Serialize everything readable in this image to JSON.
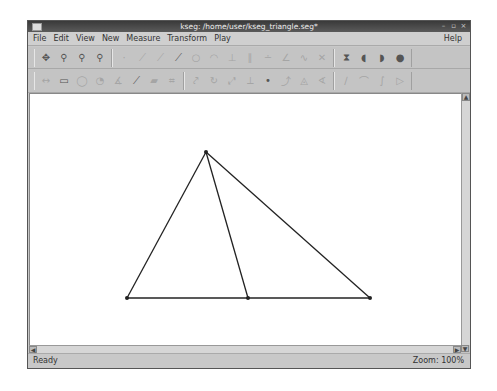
{
  "window": {
    "title": "kseg: /home/user/kseg_triangle.seg*",
    "controls": [
      "minimize",
      "maximize",
      "close"
    ]
  },
  "menubar": {
    "items": [
      {
        "label": "File",
        "accel": "F"
      },
      {
        "label": "Edit",
        "accel": "E"
      },
      {
        "label": "View",
        "accel": "V"
      },
      {
        "label": "New",
        "accel": "N"
      },
      {
        "label": "Measure",
        "accel": "u"
      },
      {
        "label": "Transform",
        "accel": "T"
      },
      {
        "label": "Play",
        "accel": "P"
      }
    ],
    "help": "Help"
  },
  "toolbar1": {
    "groups": [
      [
        {
          "name": "move-icon",
          "glyph": "✥",
          "enabled": true
        },
        {
          "name": "select-label-icon",
          "glyph": "⚲",
          "enabled": true
        },
        {
          "name": "select-grid-icon",
          "glyph": "⚲",
          "enabled": true
        },
        {
          "name": "select-text-icon",
          "glyph": "⚲",
          "enabled": true
        }
      ],
      [
        {
          "name": "point-icon",
          "glyph": "·",
          "enabled": false
        },
        {
          "name": "segment-icon",
          "glyph": "⟋",
          "enabled": false
        },
        {
          "name": "ray-icon",
          "glyph": "⟋",
          "enabled": false
        },
        {
          "name": "line-icon",
          "glyph": "⟋",
          "enabled": true
        },
        {
          "name": "circle-icon",
          "glyph": "○",
          "enabled": false
        },
        {
          "name": "arc-icon",
          "glyph": "◠",
          "enabled": false
        },
        {
          "name": "perpendicular-icon",
          "glyph": "⊥",
          "enabled": false
        },
        {
          "name": "parallel-icon",
          "glyph": "∥",
          "enabled": false
        },
        {
          "name": "midpoint-icon",
          "glyph": "∸",
          "enabled": false
        },
        {
          "name": "bisector-icon",
          "glyph": "∠",
          "enabled": false
        },
        {
          "name": "locus-icon",
          "glyph": "∿",
          "enabled": false
        },
        {
          "name": "intersection-icon",
          "glyph": "✕",
          "enabled": false
        }
      ],
      [
        {
          "name": "polygon-fill-icon",
          "glyph": "⧗",
          "enabled": true
        },
        {
          "name": "circle-interior-icon",
          "glyph": "◖",
          "enabled": true
        },
        {
          "name": "arc-sector-icon",
          "glyph": "◗",
          "enabled": true
        },
        {
          "name": "arc-segment-icon",
          "glyph": "●",
          "enabled": true
        }
      ]
    ]
  },
  "toolbar2": {
    "groups": [
      [
        {
          "name": "measure-distance-icon",
          "glyph": "↔",
          "enabled": false
        },
        {
          "name": "measure-area-icon",
          "glyph": "▭",
          "enabled": true
        },
        {
          "name": "measure-circumference-icon",
          "glyph": "◯",
          "enabled": false
        },
        {
          "name": "measure-radius-icon",
          "glyph": "◔",
          "enabled": false
        },
        {
          "name": "measure-angle-icon",
          "glyph": "∡",
          "enabled": false
        },
        {
          "name": "measure-slope-icon",
          "glyph": "⟋",
          "enabled": true
        },
        {
          "name": "measure-arc-icon",
          "glyph": "▰",
          "enabled": false
        },
        {
          "name": "calculate-icon",
          "glyph": "⌗",
          "enabled": false
        }
      ],
      [
        {
          "name": "translate-icon",
          "glyph": "⤤",
          "enabled": false
        },
        {
          "name": "rotate-icon",
          "glyph": "↻",
          "enabled": false
        },
        {
          "name": "dilate-icon",
          "glyph": "⤢",
          "enabled": false
        },
        {
          "name": "reflect-icon",
          "glyph": "⟂",
          "enabled": false
        },
        {
          "name": "mark-center-icon",
          "glyph": "•",
          "enabled": true
        },
        {
          "name": "mark-vector-icon",
          "glyph": "⤴",
          "enabled": false
        },
        {
          "name": "mark-mirror-icon",
          "glyph": "◬",
          "enabled": false
        },
        {
          "name": "mark-angle-icon",
          "glyph": "∢",
          "enabled": false
        }
      ],
      [
        {
          "name": "iterate-icon",
          "glyph": "∕",
          "enabled": false
        },
        {
          "name": "construction-icon",
          "glyph": "⌒",
          "enabled": false
        },
        {
          "name": "script-icon",
          "glyph": "∫",
          "enabled": false
        },
        {
          "name": "play-icon",
          "glyph": "▷",
          "enabled": false
        }
      ]
    ]
  },
  "canvas": {
    "background": "#ffffff",
    "stroke": "#222222",
    "points": {
      "apex": [
        176,
        58
      ],
      "base_left": [
        97,
        204
      ],
      "base_mid": [
        218,
        204
      ],
      "base_right": [
        340,
        204
      ]
    },
    "segments": [
      [
        "apex",
        "base_left"
      ],
      [
        "apex",
        "base_right"
      ],
      [
        "apex",
        "base_mid"
      ],
      [
        "base_left",
        "base_right"
      ]
    ]
  },
  "scrollbars": {
    "vertical": {
      "up": "▲",
      "down": "▼"
    },
    "horizontal": {
      "left": "◀",
      "right": "▶"
    }
  },
  "statusbar": {
    "left": "Ready",
    "right": "Zoom: 100%"
  }
}
